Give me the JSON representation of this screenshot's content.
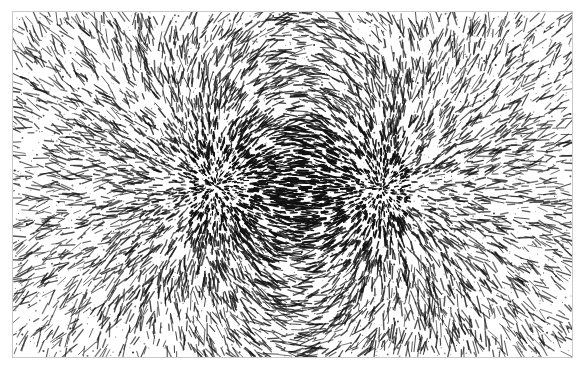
{
  "figure": {
    "caption": "",
    "width": 587,
    "height": 375,
    "background_color": "#ffffff",
    "filing_color": "#111111",
    "frame": {
      "name": "field-frame",
      "x": 12,
      "y": 11,
      "width": 561,
      "height": 347,
      "border_color": "#c9c9c9",
      "border_width": 1,
      "fill_color": "#ffffff"
    }
  },
  "chart_data": {
    "type": "scatter",
    "title": "Magnetic dipole field visualized with iron filings",
    "subtitle": "",
    "xlabel": "",
    "ylabel": "",
    "grid": false,
    "legend_position": "none",
    "xlim": [
      0,
      561
    ],
    "ylim": [
      0,
      347
    ],
    "tick_labels_x": [],
    "tick_labels_y": [],
    "annotations": [],
    "rendering": {
      "marker": "dash",
      "marker_color": "#111111",
      "orientation_rule": "tangent-to-field",
      "length_scale_min": 1.2,
      "length_scale_max": 12.0,
      "seed": 20240517
    },
    "poles": [
      {
        "name": "left-pole",
        "label": "N",
        "x": 203,
        "y": 174,
        "polarity": 1,
        "strength": 1.0,
        "core_radius": 30,
        "core_density": 1.0
      },
      {
        "name": "right-pole",
        "label": "S",
        "x": 368,
        "y": 177,
        "polarity": -1,
        "strength": 1.0,
        "core_radius": 30,
        "core_density": 1.0
      }
    ],
    "series": [
      {
        "name": "dipole-filings",
        "kind": "field-dashes",
        "count": 26000,
        "values": []
      },
      {
        "name": "background-speckle",
        "kind": "noise-dots",
        "count": 5200,
        "values": []
      }
    ],
    "density_profile": {
      "description": "Filing density falls off with distance from the two poles; highest at pole cores, strong along the inter-pole axis, sparse near frame corners.",
      "core_peak": 1.0,
      "interpole_band": 0.75,
      "mid_field": 0.4,
      "far_corner": 0.12
    }
  }
}
